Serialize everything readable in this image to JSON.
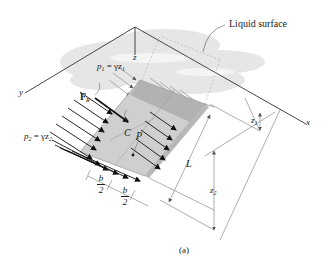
{
  "figure": {
    "caption": "(a)",
    "liquid_surface_label": "Liquid surface",
    "axes": {
      "x": "x",
      "y": "y",
      "z": "z"
    },
    "pressure_top": {
      "p": "p",
      "sub": "1",
      "eq": " = γz",
      "zsub": "1"
    },
    "pressure_bottom": {
      "p": "p",
      "sub": "2",
      "eq": " = γz",
      "zsub": "2"
    },
    "resultant_force": {
      "F": "F",
      "sub": "R"
    },
    "center_of_pressure": "C",
    "point_p": "P",
    "length": "L",
    "depth_1": {
      "z": "z",
      "sub": "1"
    },
    "depth_2": {
      "z": "z",
      "sub": "2"
    },
    "half_width": {
      "num": "b",
      "den": "2"
    },
    "colors": {
      "line": "#333333",
      "plate_fill": "#c8c8c8",
      "plate_dark": "#a9a9a9",
      "liquid": "#e6e6e6",
      "arrow": "#111111",
      "dim_line": "#777777"
    }
  }
}
